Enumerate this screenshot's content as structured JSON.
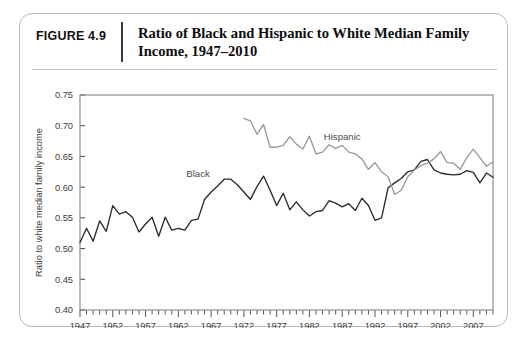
{
  "figure": {
    "number_label": "FIGURE 4.9",
    "title": "Ratio of Black and Hispanic to White Median Family Income, 1947–2010"
  },
  "chart_data": {
    "type": "line",
    "title": "Ratio of Black and Hispanic to White Median Family Income, 1947–2010",
    "xlabel": "",
    "ylabel": "Ratio to white median family income",
    "xlim": [
      1947,
      2010
    ],
    "ylim": [
      0.4,
      0.75
    ],
    "ytick_labels": [
      "0.40",
      "0.45",
      "0.50",
      "0.55",
      "0.60",
      "0.65",
      "0.70",
      "0.75"
    ],
    "ytick_values": [
      0.4,
      0.45,
      0.5,
      0.55,
      0.6,
      0.65,
      0.7,
      0.75
    ],
    "xtick_labels": [
      "1947",
      "1952",
      "1957",
      "1962",
      "1967",
      "1972",
      "1977",
      "1982",
      "1987",
      "1992",
      "1997",
      "2002",
      "2007"
    ],
    "xtick_values": [
      1947,
      1952,
      1957,
      1962,
      1967,
      1972,
      1977,
      1982,
      1987,
      1992,
      1997,
      2002,
      2007
    ],
    "xtick_minor_interval": 1,
    "grid": false,
    "legend_position": "inline-annotations",
    "series": [
      {
        "name": "Black",
        "color": "#2b2b2b",
        "label_annotation": "Black",
        "x": [
          1947,
          1948,
          1949,
          1950,
          1951,
          1952,
          1953,
          1954,
          1955,
          1956,
          1957,
          1958,
          1959,
          1960,
          1961,
          1962,
          1963,
          1964,
          1965,
          1966,
          1967,
          1968,
          1969,
          1970,
          1971,
          1972,
          1973,
          1974,
          1975,
          1976,
          1977,
          1978,
          1979,
          1980,
          1981,
          1982,
          1983,
          1984,
          1985,
          1986,
          1987,
          1988,
          1989,
          1990,
          1991,
          1992,
          1993,
          1994,
          1995,
          1996,
          1997,
          1998,
          1999,
          2000,
          2001,
          2002,
          2003,
          2004,
          2005,
          2006,
          2007,
          2008,
          2009,
          2010
        ],
        "y": [
          0.51,
          0.533,
          0.512,
          0.545,
          0.528,
          0.57,
          0.556,
          0.56,
          0.551,
          0.527,
          0.54,
          0.551,
          0.52,
          0.551,
          0.53,
          0.533,
          0.53,
          0.546,
          0.548,
          0.58,
          0.592,
          0.602,
          0.613,
          0.613,
          0.604,
          0.592,
          0.58,
          0.601,
          0.618,
          0.595,
          0.57,
          0.59,
          0.563,
          0.576,
          0.563,
          0.553,
          0.56,
          0.562,
          0.578,
          0.574,
          0.568,
          0.573,
          0.562,
          0.582,
          0.57,
          0.546,
          0.55,
          0.599,
          0.607,
          0.614,
          0.625,
          0.628,
          0.642,
          0.645,
          0.628,
          0.623,
          0.621,
          0.62,
          0.621,
          0.627,
          0.624,
          0.607,
          0.623,
          0.616
        ]
      },
      {
        "name": "Hispanic",
        "color": "#9a9a9a",
        "label_annotation": "Hispanic",
        "x": [
          1972,
          1973,
          1974,
          1975,
          1976,
          1977,
          1978,
          1979,
          1980,
          1981,
          1982,
          1983,
          1984,
          1985,
          1986,
          1987,
          1988,
          1989,
          1990,
          1991,
          1992,
          1993,
          1994,
          1995,
          1996,
          1997,
          1998,
          1999,
          2000,
          2001,
          2002,
          2003,
          2004,
          2005,
          2006,
          2007,
          2008,
          2009,
          2010
        ],
        "y": [
          0.712,
          0.708,
          0.686,
          0.702,
          0.665,
          0.665,
          0.668,
          0.682,
          0.67,
          0.662,
          0.683,
          0.654,
          0.657,
          0.669,
          0.663,
          0.668,
          0.657,
          0.654,
          0.646,
          0.629,
          0.64,
          0.625,
          0.617,
          0.588,
          0.595,
          0.617,
          0.628,
          0.635,
          0.639,
          0.646,
          0.658,
          0.64,
          0.639,
          0.629,
          0.648,
          0.662,
          0.648,
          0.634,
          0.641
        ]
      }
    ],
    "annotations": [
      {
        "text": "Black",
        "x": 1965,
        "y": 0.617
      },
      {
        "text": "Hispanic",
        "x": 1987,
        "y": 0.677
      }
    ]
  }
}
